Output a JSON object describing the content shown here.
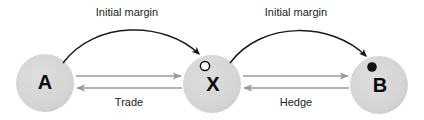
{
  "diagram": {
    "type": "node-link-diagram",
    "width": 424,
    "height": 120,
    "background_color": "#ffffff",
    "colors": {
      "node_fill": "#d4d4d4",
      "node_fill_light": "#dcdcdc",
      "curved_arrow": "#1a1a1a",
      "straight_arrow": "#9a9a9a",
      "marker_outline": "#111111",
      "marker_fill": "#111111",
      "label_text": "#1b1b1b",
      "node_text": "#0a0a0a"
    },
    "nodes": [
      {
        "id": "A",
        "label": "A",
        "cx": 45,
        "cy": 83,
        "r": 29,
        "marker": "none"
      },
      {
        "id": "X",
        "label": "X",
        "cx": 212,
        "cy": 84,
        "r": 29,
        "marker": "hollow-circle",
        "marker_cx": 205,
        "marker_cy": 66,
        "marker_r": 4.5
      },
      {
        "id": "B",
        "label": "B",
        "cx": 379,
        "cy": 85,
        "r": 29,
        "marker": "filled-circle",
        "marker_cx": 372,
        "marker_cy": 67,
        "marker_r": 4.5
      }
    ],
    "curved_edges": [
      {
        "id": "initial-margin-a-to-x",
        "label": "Initial margin",
        "from": "A",
        "to": "X",
        "label_x": 127,
        "label_y": 13,
        "path": "M 63 63 C 95 20, 165 21, 200 55"
      },
      {
        "id": "initial-margin-b-to-x",
        "label": "Initial margin",
        "from": "B",
        "to": "B-marker",
        "label_x": 296,
        "label_y": 13,
        "path": "M 230 63 C 262 20, 332 21, 367 57"
      }
    ],
    "straight_edges": [
      {
        "id": "trade-a-to-x",
        "label": "",
        "from": "A",
        "to": "X",
        "direction": "right",
        "x1": 76,
        "x2": 181,
        "y": 76
      },
      {
        "id": "trade-x-to-a",
        "label": "Trade",
        "from": "X",
        "to": "A",
        "direction": "left",
        "x1": 182,
        "x2": 76,
        "y": 88,
        "label_x": 129,
        "label_y": 103
      },
      {
        "id": "hedge-x-to-b",
        "label": "",
        "from": "X",
        "to": "B",
        "direction": "right",
        "x1": 243,
        "x2": 349,
        "y": 76
      },
      {
        "id": "hedge-b-to-x",
        "label": "Hedge",
        "from": "B",
        "to": "X",
        "direction": "left",
        "x1": 350,
        "x2": 243,
        "y": 88,
        "label_x": 296,
        "label_y": 103
      }
    ]
  }
}
